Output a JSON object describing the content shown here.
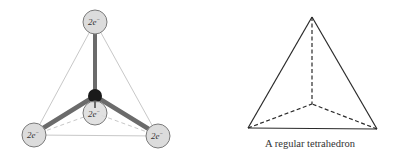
{
  "left_figure": {
    "name": "electron-pair tetrahedral model",
    "orbitals": [
      {
        "id": "top",
        "label": "2e",
        "sup": "−",
        "cx": 95,
        "cy": 22
      },
      {
        "id": "bottom-left",
        "label": "2e",
        "sup": "−",
        "cx": 34,
        "cy": 135
      },
      {
        "id": "bottom-front",
        "label": "2e",
        "sup": "−",
        "cx": 95,
        "cy": 113
      },
      {
        "id": "bottom-right",
        "label": "2e",
        "sup": "−",
        "cx": 158,
        "cy": 136
      }
    ],
    "center_atom": {
      "cx": 95,
      "cy": 96
    }
  },
  "right_figure": {
    "name": "regular tetrahedron",
    "caption": "A regular tetrahedron",
    "vertices": {
      "apex": [
        312,
        17
      ],
      "back": [
        312,
        104
      ],
      "left": [
        248,
        128
      ],
      "right": [
        377,
        129
      ]
    }
  },
  "colors": {
    "bond": "#6b6b6b",
    "orbital_fill": "#dcdcdc",
    "orbital_stroke": "#7a7a7a",
    "edge_light": "#c8c8c8",
    "atom": "#1a1a1a",
    "line": "#2a2a2a"
  }
}
